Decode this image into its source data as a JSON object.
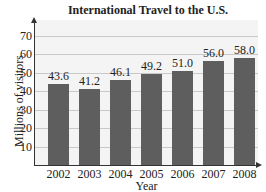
{
  "chart_data": {
    "type": "bar",
    "title": "International Travel to the U.S.",
    "xlabel": "Year",
    "ylabel": "Millions of visitors",
    "categories": [
      "2002",
      "2003",
      "2004",
      "2005",
      "2006",
      "2007",
      "2008"
    ],
    "values": [
      43.6,
      41.2,
      46.1,
      49.2,
      51.0,
      56.0,
      58.0
    ],
    "value_labels": [
      "43.6",
      "41.2",
      "46.1",
      "49.2",
      "51.0",
      "56.0",
      "58.0"
    ],
    "yticks": [
      "10",
      "20",
      "30",
      "40",
      "50",
      "60",
      "70"
    ],
    "ylim": [
      0,
      75
    ],
    "grid": true,
    "legend": null,
    "colors": {
      "bar": "#5e5e5e",
      "plot_bg": "#f4f4f4",
      "grid": "#c9c9c9"
    }
  }
}
